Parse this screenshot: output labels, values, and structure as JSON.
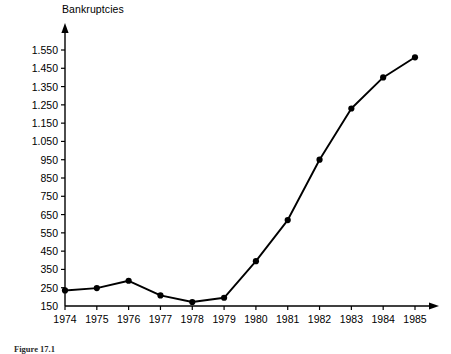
{
  "figure": {
    "caption": "Figure 17.1"
  },
  "chart_data": {
    "type": "line",
    "title": "",
    "ylabel": "Bankruptcies",
    "xlabel": "",
    "categories": [
      "1974",
      "1975",
      "1976",
      "1977",
      "1978",
      "1979",
      "1980",
      "1981",
      "1982",
      "1983",
      "1984",
      "1985"
    ],
    "values": [
      235,
      248,
      288,
      208,
      172,
      195,
      395,
      620,
      950,
      1230,
      1400,
      1510
    ],
    "series": [
      {
        "name": "Bankruptcies",
        "values": [
          235,
          248,
          288,
          208,
          172,
          195,
          395,
          620,
          950,
          1230,
          1400,
          1510
        ]
      }
    ],
    "ylim": [
      150,
      1550
    ],
    "ytick_labels": [
      "150",
      "250",
      "350",
      "450",
      "550",
      "650",
      "750",
      "850",
      "950",
      "1.050",
      "1.150",
      "1.250",
      "1.350",
      "1.450",
      "1.550"
    ],
    "ytick_values": [
      150,
      250,
      350,
      450,
      550,
      650,
      750,
      850,
      950,
      1050,
      1150,
      1250,
      1350,
      1450,
      1550
    ],
    "grid": false,
    "legend": "none",
    "marker": "filled-circle",
    "line_color": "#000000",
    "marker_color": "#000000",
    "axis_color": "#000000",
    "background_color": "#ffffff"
  }
}
